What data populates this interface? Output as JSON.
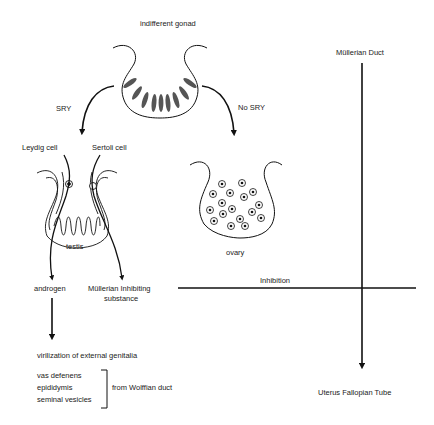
{
  "title": "indifferent gonad",
  "pathways": {
    "sry_label": "SRY",
    "no_sry_label": "No SRY"
  },
  "testis": {
    "label": "testis",
    "leydig_label": "Leydig cell",
    "sertoli_label": "Sertoli cell",
    "androgen_label": "androgen",
    "mis_label_line1": "Müllerian Inhibiting",
    "mis_label_line2": "substance"
  },
  "ovary": {
    "label": "ovary"
  },
  "mullerian": {
    "top_label": "Müllerian Duct",
    "bottom_label": "Uterus Fallopian Tube",
    "inhibition_label": "Inhibition"
  },
  "male_outcomes": {
    "virilization": "virilization of external genitalia",
    "wolffian_items": [
      "vas defenens",
      "epididymis",
      "seminal vesicles"
    ],
    "wolffian_source": "from Wolffian duct"
  },
  "colors": {
    "line": "#111111",
    "ellipse_fill": "#555555",
    "text": "#222222"
  }
}
